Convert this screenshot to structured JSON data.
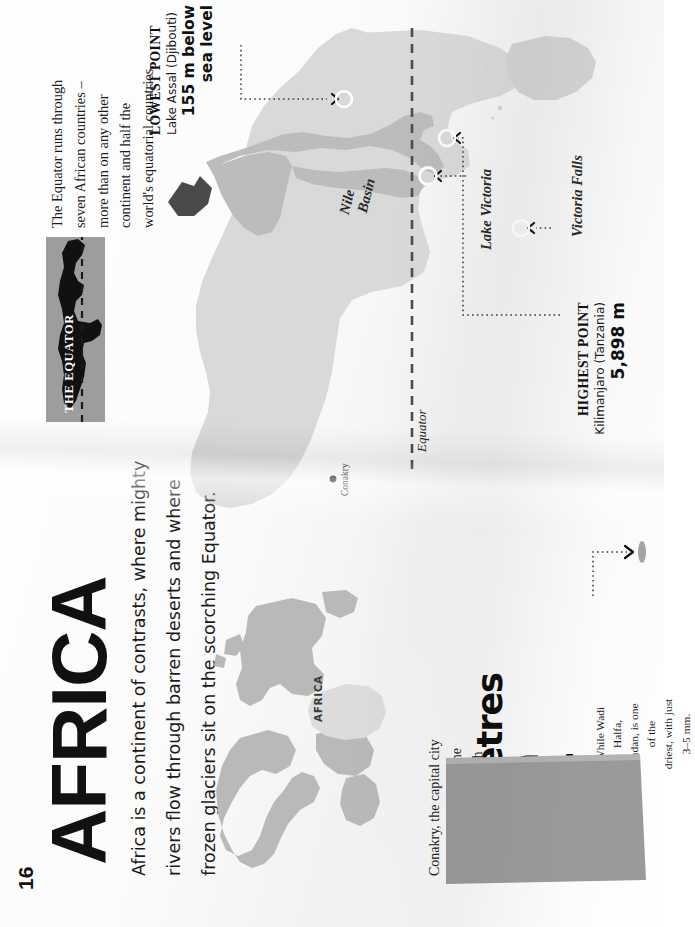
{
  "page": {
    "number": "16",
    "title": "AFRICA",
    "intro_lines": [
      "Africa is a continent of contrasts, where mighty",
      "rivers flow through barren deserts and where",
      "frozen glaciers sit on the scorching Equator."
    ]
  },
  "equator_note": {
    "lines": [
      "The Equator runs through",
      "seven African countries –",
      "more than on any other",
      "continent and half the",
      "world's equatorial countries."
    ]
  },
  "equator_inset": {
    "band_label": "THE EQUATOR"
  },
  "lowest_point": {
    "kicker": "LOWEST POINT",
    "place": "Lake Assal (Djibouti)",
    "value_lines": [
      "155 m below",
      "sea level"
    ]
  },
  "highest_point": {
    "kicker": "HIGHEST POINT",
    "place": "Kilimanjaro (Tanzania)",
    "value": "5,898 m"
  },
  "map": {
    "labels": {
      "nile_basin_line1": "Nile",
      "nile_basin_line2": "Basin",
      "lake_victoria": "Lake Victoria",
      "victoria_falls": "Victoria Falls",
      "equator": "Equator",
      "conakry": "Conakry"
    }
  },
  "world_inset": {
    "label": "AFRICA"
  },
  "rainfall": {
    "intro_lines": [
      "Conakry, the capital city",
      "of Guinea is one of the",
      "wettest in Africa, with"
    ],
    "headline_lines": [
      "3.7 metres",
      "of rain",
      "a year."
    ],
    "contrast_lines": [
      "While Wadi Halfa,",
      "Sudan, is one of the",
      "driest, with just 3–5 mm."
    ]
  },
  "colors": {
    "land": "#d8d8d8",
    "land_dark": "#c0c0c0",
    "basin": "#b4b4b4",
    "ink": "#111111",
    "band": "#9d9d9d",
    "gauge": "#9a9a9a",
    "world_land": "#b9b9b9",
    "world_africa": "#d9d9d9"
  }
}
